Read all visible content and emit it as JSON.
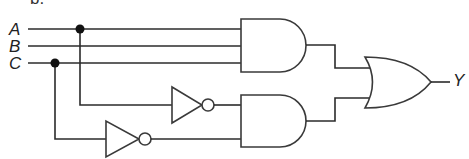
{
  "figure_label": "b.",
  "inputs": [
    {
      "name": "A"
    },
    {
      "name": "B"
    },
    {
      "name": "C"
    }
  ],
  "output": {
    "name": "Y"
  },
  "gates": [
    {
      "id": "and1",
      "type": "AND",
      "inputs": [
        "A",
        "B",
        "C"
      ]
    },
    {
      "id": "not1",
      "type": "NOT",
      "inputs": [
        "A"
      ]
    },
    {
      "id": "not2",
      "type": "NOT",
      "inputs": [
        "C"
      ]
    },
    {
      "id": "and2",
      "type": "AND",
      "inputs": [
        "NOT A",
        "NOT C"
      ]
    },
    {
      "id": "or1",
      "type": "OR",
      "inputs": [
        "and1",
        "and2"
      ],
      "output": "Y"
    }
  ],
  "colors": {
    "line": "#2b2b2b",
    "junction": "#111111"
  }
}
